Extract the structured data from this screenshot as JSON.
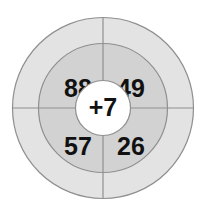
{
  "diagram": {
    "type": "concentric-target-quadrant-diagram",
    "title": "",
    "background_color": "#ffffff",
    "center": {
      "x": 103,
      "y": 108
    },
    "rings": [
      {
        "name": "outer-ring",
        "radius": 91,
        "fill": "#e3e3e3",
        "stroke": "#8f8f8f",
        "label": ""
      },
      {
        "name": "middle-ring",
        "radius": 65,
        "fill": "#d2d2d2",
        "stroke": "#8f8f8f",
        "label": ""
      },
      {
        "name": "inner-circle",
        "radius": 28,
        "fill": "#ffffff",
        "stroke": "#8f8f8f",
        "label": ""
      }
    ],
    "crosshair": {
      "name": "crosshair-lines",
      "color": "#8f8f8f",
      "vertical": true,
      "horizontal": true
    },
    "center_value": "+7",
    "quadrants": [
      {
        "position": "top-left",
        "value": "88",
        "x": 78,
        "y": 90
      },
      {
        "position": "top-right",
        "value": "49",
        "x": 131,
        "y": 90
      },
      {
        "position": "bottom-left",
        "value": "57",
        "x": 78,
        "y": 148
      },
      {
        "position": "bottom-right",
        "value": "26",
        "x": 131,
        "y": 148
      }
    ]
  }
}
